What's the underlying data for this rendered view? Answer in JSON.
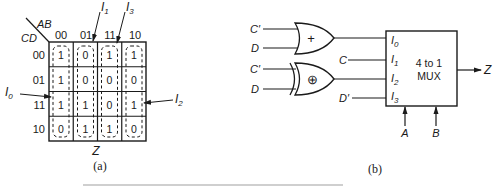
{
  "figure": {
    "panel_a": {
      "label": "(a)",
      "corner_row_var": "CD",
      "corner_col_var": "AB",
      "col_headers": [
        "00",
        "01",
        "11",
        "10"
      ],
      "row_headers": [
        "00",
        "01",
        "11",
        "10"
      ],
      "cells": [
        [
          "1",
          "0",
          "1",
          "1"
        ],
        [
          "1",
          "0",
          "0",
          "0"
        ],
        [
          "1",
          "1",
          "0",
          "1"
        ],
        [
          "0",
          "1",
          "1",
          "0"
        ]
      ],
      "output_label": "Z",
      "callouts": [
        {
          "name": "I",
          "sub": "0"
        },
        {
          "name": "I",
          "sub": "1"
        },
        {
          "name": "I",
          "sub": "2"
        },
        {
          "name": "I",
          "sub": "3"
        }
      ]
    },
    "panel_b": {
      "label": "(b)",
      "or_gate": {
        "symbol": "+",
        "inputs": [
          "C′",
          "D"
        ]
      },
      "xor_gate": {
        "symbol": "⊕",
        "inputs": [
          "C′",
          "D"
        ]
      },
      "direct_inputs": {
        "i1": "C",
        "i3": "D′"
      },
      "mux": {
        "title_line1": "4 to 1",
        "title_line2": "MUX",
        "inputs": [
          {
            "name": "I",
            "sub": "0"
          },
          {
            "name": "I",
            "sub": "1"
          },
          {
            "name": "I",
            "sub": "2"
          },
          {
            "name": "I",
            "sub": "3"
          }
        ],
        "selects": [
          "A",
          "B"
        ],
        "output": "Z"
      }
    }
  }
}
